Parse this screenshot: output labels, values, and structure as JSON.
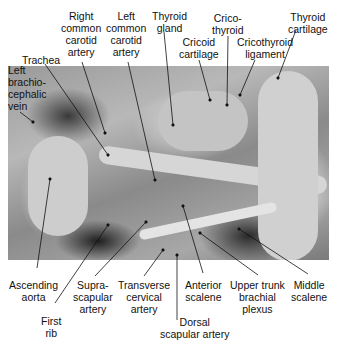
{
  "figure": {
    "type": "labeled anatomical photograph (root of the neck dissection)",
    "labels_top": [
      {
        "id": "trachea",
        "text": "Trachea"
      },
      {
        "id": "right_common_carotid",
        "text": "Right\ncommon\ncarotid\nartery"
      },
      {
        "id": "left_common_carotid",
        "text": "Left\ncommon\ncarotid\nartery"
      },
      {
        "id": "thyroid_gland",
        "text": "Thyroid\ngland"
      },
      {
        "id": "cricoid_cartilage",
        "text": "Cricoid\ncartilage"
      },
      {
        "id": "cricothyroid",
        "text": "Crico-\nthyroid"
      },
      {
        "id": "cricothyroid_ligament",
        "text": "Cricothyroid\nligament"
      },
      {
        "id": "thyroid_cartilage",
        "text": "Thyroid\ncartilage"
      },
      {
        "id": "left_brachiocephalic_vein",
        "text": "Left\nbrachio-\ncephalic\nvein"
      }
    ],
    "labels_bottom": [
      {
        "id": "ascending_aorta",
        "text": "Ascending\naorta"
      },
      {
        "id": "first_rib",
        "text": "First\nrib"
      },
      {
        "id": "suprascapular_artery",
        "text": "Supra-\nscapular\nartery"
      },
      {
        "id": "transverse_cervical_artery",
        "text": "Transverse\ncervical\nartery"
      },
      {
        "id": "dorsal_scapular_artery",
        "text": "Dorsal\nscapular artery"
      },
      {
        "id": "anterior_scalene",
        "text": "Anterior\nscalene"
      },
      {
        "id": "upper_trunk_brachial_plexus",
        "text": "Upper trunk\nbrachial\nplexus"
      },
      {
        "id": "middle_scalene",
        "text": "Middle\nscalene"
      }
    ]
  }
}
